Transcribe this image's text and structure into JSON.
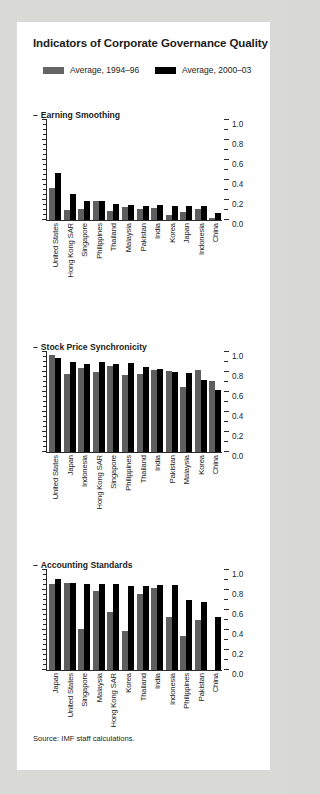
{
  "card": {
    "title": "Indicators of Corporate Governance Quality",
    "source": "Source: IMF staff calculations."
  },
  "legend": {
    "items": [
      {
        "label": "Average, 1994–96",
        "color": "#5e5e5e",
        "name": "legend-swatch-gray"
      },
      {
        "label": "Average, 2000–03",
        "color": "#000000",
        "name": "legend-swatch-black"
      }
    ]
  },
  "axis": {
    "ticks": [
      "1.0",
      "0.8",
      "0.6",
      "0.4",
      "0.2",
      "0.0"
    ],
    "values": [
      1.0,
      0.8,
      0.6,
      0.4,
      0.2,
      0.0
    ]
  },
  "chart_data": [
    {
      "type": "bar",
      "title": "Earning Smoothing",
      "xlabel": "",
      "ylabel": "",
      "ylim": [
        0.0,
        1.0
      ],
      "grid": false,
      "legend_position": "top",
      "categories": [
        "United States",
        "Hong Kong SAR",
        "Singapore",
        "Philippines",
        "Thailand",
        "Malaysia",
        "Pakistan",
        "India",
        "Korea",
        "Japan",
        "Indonesia",
        "China"
      ],
      "series": [
        {
          "name": "Average, 1994–96",
          "color": "#5e5e5e",
          "values": [
            0.32,
            0.1,
            0.11,
            0.19,
            0.09,
            0.13,
            0.11,
            0.12,
            0.05,
            0.08,
            0.11,
            0.02
          ]
        },
        {
          "name": "Average, 2000–03",
          "color": "#000000",
          "values": [
            0.47,
            0.26,
            0.19,
            0.19,
            0.16,
            0.15,
            0.14,
            0.15,
            0.14,
            0.14,
            0.14,
            0.07
          ]
        }
      ]
    },
    {
      "type": "bar",
      "title": "Stock Price Synchronicity",
      "xlabel": "",
      "ylabel": "",
      "ylim": [
        0.0,
        1.0
      ],
      "grid": false,
      "legend_position": "top",
      "categories": [
        "United States",
        "Japan",
        "Indonesia",
        "Hong Kong SAR",
        "Singapore",
        "Philippines",
        "Thailand",
        "India",
        "Pakistan",
        "Malaysia",
        "Korea",
        "China"
      ],
      "series": [
        {
          "name": "Average, 1994–96",
          "color": "#5e5e5e",
          "values": [
            0.97,
            0.78,
            0.84,
            0.8,
            0.86,
            0.77,
            0.78,
            0.82,
            0.81,
            0.65,
            0.82,
            0.71
          ]
        },
        {
          "name": "Average, 2000–03",
          "color": "#000000",
          "values": [
            0.94,
            0.9,
            0.88,
            0.9,
            0.88,
            0.89,
            0.85,
            0.83,
            0.8,
            0.79,
            0.72,
            0.62
          ]
        }
      ]
    },
    {
      "type": "bar",
      "title": "Accounting Standards",
      "xlabel": "",
      "ylabel": "",
      "ylim": [
        0.0,
        1.0
      ],
      "grid": false,
      "legend_position": "top",
      "categories": [
        "Japan",
        "United States",
        "Singapore",
        "Malaysia",
        "Hong Kong SAR",
        "Korea",
        "Thailand",
        "India",
        "Indonesia",
        "Philippines",
        "Pakistan",
        "China"
      ],
      "series": [
        {
          "name": "Average, 1994–96",
          "color": "#5e5e5e",
          "values": [
            0.86,
            0.87,
            0.41,
            0.79,
            0.58,
            0.39,
            0.76,
            0.82,
            0.53,
            0.34,
            0.5,
            0.0
          ]
        },
        {
          "name": "Average, 2000–03",
          "color": "#000000",
          "values": [
            0.91,
            0.87,
            0.86,
            0.86,
            0.86,
            0.84,
            0.84,
            0.85,
            0.85,
            0.7,
            0.68,
            0.53
          ]
        }
      ]
    }
  ]
}
